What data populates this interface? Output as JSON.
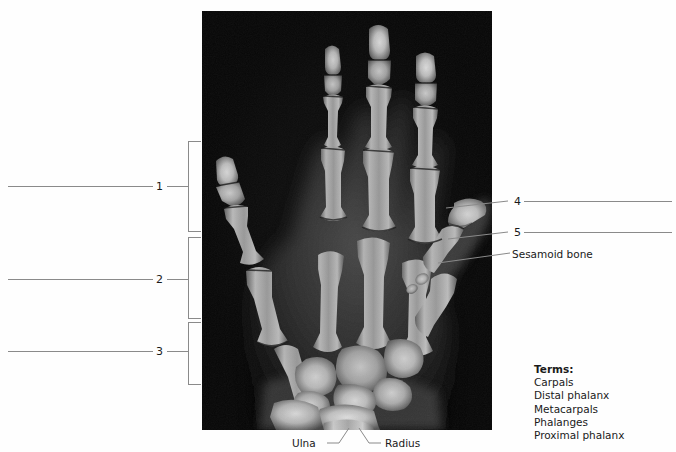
{
  "figure": {
    "type": "anatomy-labeling-worksheet",
    "background_color": "#fefefe",
    "line_color": "#8a8a8a",
    "text_color": "#1a1a1a"
  },
  "bracket_callouts": [
    {
      "number": "1",
      "bracket_top": 141,
      "bracket_bottom": 231,
      "label_y": 185
    },
    {
      "number": "2",
      "bracket_top": 237,
      "bracket_bottom": 318,
      "label_y": 279
    },
    {
      "number": "3",
      "bracket_top": 322,
      "bracket_bottom": 384,
      "label_y": 351
    }
  ],
  "right_callouts": [
    {
      "number": "4",
      "label_y": 201
    },
    {
      "number": "5",
      "label_y": 232
    }
  ],
  "named_callouts": [
    {
      "text": "Sesamoid bone",
      "x": 512,
      "y": 249
    }
  ],
  "bone_labels": [
    {
      "text": "Ulna",
      "x": 292,
      "y": 438
    },
    {
      "text": "Radius",
      "x": 385,
      "y": 438
    }
  ],
  "terms": {
    "heading": "Terms:",
    "items": [
      "Carpals",
      "Distal phalanx",
      "Metacarpals",
      "Phalanges",
      "Proximal phalanx"
    ]
  }
}
